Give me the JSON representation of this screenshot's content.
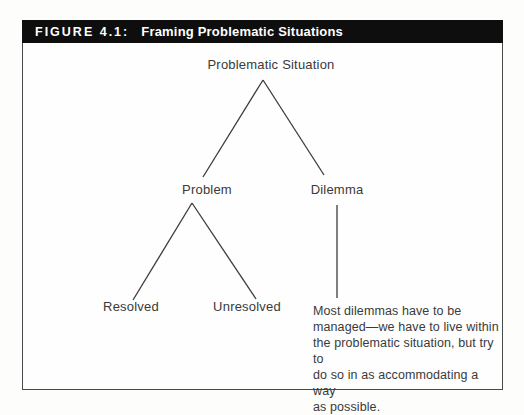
{
  "figure": {
    "label": "FIGURE 4.1:",
    "title": "Framing Problematic Situations"
  },
  "tree": {
    "root": "Problematic Situation",
    "level1": [
      {
        "label": "Problem"
      },
      {
        "label": "Dilemma"
      }
    ],
    "level2": [
      {
        "label": "Resolved"
      },
      {
        "label": "Unresolved"
      }
    ],
    "note_lines": [
      "Most dilemmas have to be",
      "managed—we have to live within",
      "the problematic situation, but try to",
      "do so in as accommodating a way",
      "as possible."
    ],
    "note_text": "Most dilemmas have to be managed—we have to live within the problematic situation, but try to do so in as accommodating a way as possible."
  },
  "colors": {
    "header_bg": "#0e0e0e",
    "header_text": "#ffffff",
    "line": "#3b3b3b",
    "text": "#3a3a3a",
    "border": "#4a4a4a",
    "background": "#fefefe"
  }
}
